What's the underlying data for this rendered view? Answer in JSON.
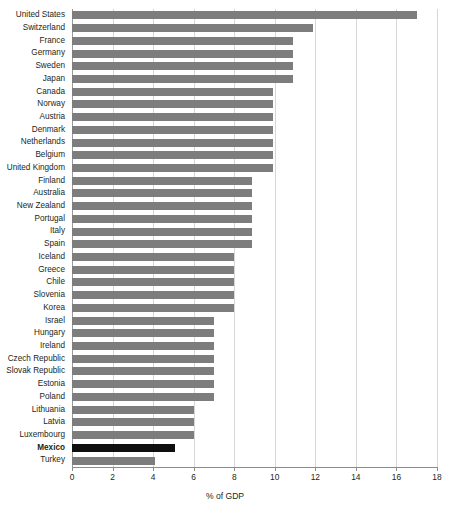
{
  "chart_data": {
    "type": "bar",
    "orientation": "horizontal",
    "title": "",
    "subtitle": "",
    "xlabel": "% of GDP",
    "ylabel": "",
    "xlim": [
      0,
      18
    ],
    "xticks": [
      0,
      2,
      4,
      6,
      8,
      10,
      12,
      14,
      16,
      18
    ],
    "xtick_labels": [
      "0",
      "2",
      "4",
      "6",
      "8",
      "10",
      "12",
      "14",
      "16",
      "18"
    ],
    "grid": "vertical",
    "legend": "none",
    "bar_color": "#7d7d7d",
    "highlight_color": "#0f0f0f",
    "highlight_category": "Mexico",
    "categories": [
      "United States",
      "Switzerland",
      "France",
      "Germany",
      "Sweden",
      "Japan",
      "Canada",
      "Norway",
      "Austria",
      "Denmark",
      "Netherlands",
      "Belgium",
      "United Kingdom",
      "Finland",
      "Australia",
      "New Zealand",
      "Portugal",
      "Italy",
      "Spain",
      "Iceland",
      "Greece",
      "Chile",
      "Slovenia",
      "Korea",
      "Israel",
      "Hungary",
      "Ireland",
      "Czech Republic",
      "Slovak Republic",
      "Estonia",
      "Poland",
      "Lithuania",
      "Latvia",
      "Luxembourg",
      "Mexico",
      "Turkey"
    ],
    "values": [
      17.0,
      11.9,
      10.9,
      10.9,
      10.9,
      10.9,
      9.9,
      9.9,
      9.9,
      9.9,
      9.9,
      9.9,
      9.9,
      8.9,
      8.9,
      8.9,
      8.9,
      8.9,
      8.9,
      8.0,
      8.0,
      8.0,
      8.0,
      8.0,
      7.0,
      7.0,
      7.0,
      7.0,
      7.0,
      7.0,
      7.0,
      6.0,
      6.0,
      6.0,
      5.1,
      4.1
    ]
  }
}
